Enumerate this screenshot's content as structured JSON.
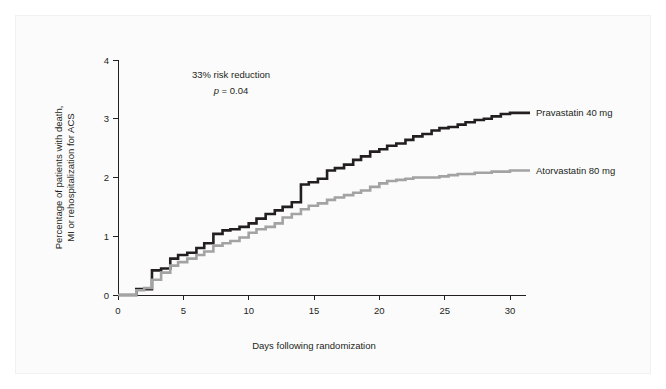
{
  "figure": {
    "background_color": "#fbfbfb",
    "page_background_color": "#ffffff"
  },
  "annotations": {
    "risk_reduction": "33% risk reduction",
    "p_value_symbol": "p",
    "p_value_text": " = 0.04"
  },
  "legend": {
    "entries": [
      {
        "label": "Pravastatin 40 mg",
        "color": "#231f20",
        "name": "legend-pravastatin"
      },
      {
        "label": "Atorvastatin 80 mg",
        "color": "#a3a3a3",
        "name": "legend-atorvastatin"
      }
    ]
  },
  "chart_data": {
    "type": "line",
    "title": "",
    "subtitle": "",
    "xlabel": "Days following randomization",
    "ylabel": "Percentage of patients with death, MI or rehospitalization for ACS",
    "ylabel_line1": "Percentage of patients with death,",
    "ylabel_line2": "MI or rehospitalization for ACS",
    "xlim": [
      0,
      30
    ],
    "ylim": [
      0,
      4
    ],
    "xticks": [
      0,
      5,
      10,
      15,
      20,
      25,
      30
    ],
    "yticks": [
      0,
      1,
      2,
      3,
      4
    ],
    "xtick_labels": [
      "0",
      "5",
      "10",
      "15",
      "20",
      "25",
      "30"
    ],
    "ytick_labels": [
      "0",
      "1",
      "2",
      "3",
      "4"
    ],
    "grid": false,
    "legend_position": "right",
    "step_style": "post",
    "annotations": [
      "33% risk reduction",
      "p = 0.04"
    ],
    "series": [
      {
        "name": "Pravastatin 40 mg",
        "color": "#231f20",
        "line_width": 2.6,
        "x": [
          0,
          1.4,
          1.9,
          2.6,
          3.3,
          4.0,
          4.6,
          5.3,
          6.0,
          6.6,
          7.3,
          8.0,
          8.6,
          9.3,
          10.0,
          10.6,
          11.3,
          12.0,
          12.6,
          13.3,
          14.0,
          14.6,
          15.3,
          16.0,
          16.6,
          17.3,
          18.0,
          18.6,
          19.3,
          20.0,
          20.6,
          21.3,
          22.0,
          22.6,
          23.3,
          24.0,
          24.6,
          25.3,
          26.0,
          26.6,
          27.3,
          28.0,
          28.6,
          29.3,
          30.0
        ],
        "y": [
          0,
          0.1,
          0.1,
          0.42,
          0.45,
          0.62,
          0.68,
          0.72,
          0.8,
          0.88,
          1.04,
          1.1,
          1.12,
          1.16,
          1.22,
          1.3,
          1.38,
          1.44,
          1.5,
          1.58,
          1.88,
          1.92,
          1.98,
          2.12,
          2.16,
          2.22,
          2.3,
          2.36,
          2.44,
          2.48,
          2.54,
          2.58,
          2.64,
          2.7,
          2.74,
          2.8,
          2.84,
          2.86,
          2.9,
          2.94,
          2.98,
          3.0,
          3.04,
          3.08,
          3.1
        ],
        "final_value": 3.1
      },
      {
        "name": "Atorvastatin 80 mg",
        "color": "#a3a3a3",
        "line_width": 2.6,
        "x": [
          0,
          1.4,
          2.0,
          2.6,
          3.3,
          4.0,
          4.6,
          5.3,
          6.0,
          6.6,
          7.3,
          8.0,
          8.6,
          9.3,
          10.0,
          10.6,
          11.3,
          12.0,
          12.6,
          13.3,
          14.0,
          14.6,
          15.3,
          16.0,
          16.6,
          17.3,
          18.0,
          18.6,
          19.3,
          20.0,
          20.6,
          21.3,
          22.0,
          22.6,
          23.3,
          24.0,
          24.6,
          25.3,
          26.0,
          26.6,
          27.3,
          28.0,
          28.6,
          29.3,
          30.0
        ],
        "y": [
          0,
          0.08,
          0.12,
          0.26,
          0.38,
          0.5,
          0.56,
          0.62,
          0.68,
          0.74,
          0.84,
          0.88,
          0.92,
          0.98,
          1.06,
          1.12,
          1.16,
          1.22,
          1.32,
          1.38,
          1.46,
          1.52,
          1.56,
          1.62,
          1.66,
          1.7,
          1.74,
          1.78,
          1.84,
          1.9,
          1.94,
          1.96,
          1.98,
          2.0,
          2.0,
          2.0,
          2.02,
          2.04,
          2.06,
          2.06,
          2.08,
          2.08,
          2.1,
          2.1,
          2.12
        ],
        "final_value": 2.1
      }
    ]
  }
}
